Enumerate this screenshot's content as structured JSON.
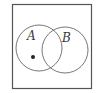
{
  "diagram": {
    "type": "venn",
    "universe": {
      "x": 12.5,
      "y": 4.5,
      "width": 79,
      "height": 84
    },
    "sets": [
      {
        "label": "A",
        "cx": 39,
        "cy": 48,
        "r": 23,
        "label_x": 27,
        "label_y": 40
      },
      {
        "label": "B",
        "cx": 65,
        "cy": 50,
        "r": 23,
        "label_x": 62,
        "label_y": 42
      }
    ],
    "point": {
      "cx": 33,
      "cy": 57,
      "r": 2,
      "region": "A only"
    },
    "colors": {
      "stroke": "#555555",
      "point": "#222222",
      "background": "#ffffff"
    }
  }
}
